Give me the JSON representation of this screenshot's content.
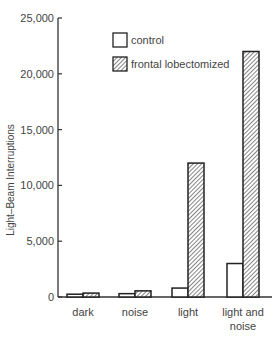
{
  "chart_data": {
    "type": "bar",
    "title": "",
    "xlabel": "",
    "ylabel": "Light–Beam Interruptions",
    "ylim": [
      0,
      25000
    ],
    "yticks": [
      0,
      5000,
      10000,
      15000,
      20000,
      25000
    ],
    "ytick_labels": [
      "0",
      "5,000",
      "10,000",
      "15,000",
      "20,000",
      "25,000"
    ],
    "categories": [
      "dark",
      "noise",
      "light",
      "light and noise"
    ],
    "category_label_lines": [
      [
        "dark"
      ],
      [
        "noise"
      ],
      [
        "light"
      ],
      [
        "light and",
        "noise"
      ]
    ],
    "series": [
      {
        "name": "control",
        "fill": "none",
        "values": [
          250,
          300,
          800,
          3000
        ]
      },
      {
        "name": "frontal lobectomized",
        "fill": "hatched",
        "values": [
          350,
          550,
          12000,
          22000
        ]
      }
    ],
    "legend": {
      "position": "upper-center",
      "entries": [
        "control",
        "frontal lobectomized"
      ]
    },
    "grid": false
  }
}
